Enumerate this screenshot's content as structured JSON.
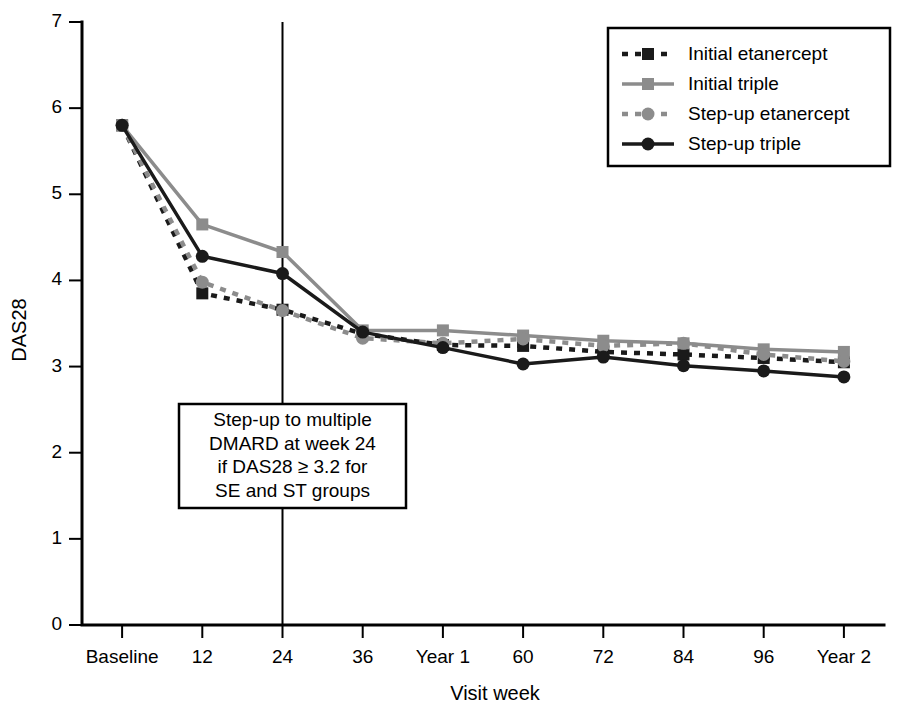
{
  "chart_data": {
    "type": "line",
    "title": "",
    "xlabel": "Visit week",
    "ylabel": "DAS28",
    "categories": [
      "Baseline",
      "12",
      "24",
      "36",
      "Year 1",
      "60",
      "72",
      "84",
      "96",
      "Year 2"
    ],
    "x": [
      0,
      1,
      2,
      3,
      4,
      5,
      6,
      7,
      8,
      9
    ],
    "ylim": [
      0,
      7
    ],
    "yticks": [
      "0",
      "1",
      "2",
      "3",
      "4",
      "5",
      "6",
      "7"
    ],
    "grid": false,
    "legend_position": "top-right",
    "series": [
      {
        "name": "Initial etanercept",
        "color": "#1a1a1a",
        "dash": "dashed",
        "marker": "square",
        "values": [
          5.8,
          3.85,
          3.66,
          3.38,
          3.25,
          3.24,
          3.17,
          3.14,
          3.1,
          3.05
        ]
      },
      {
        "name": "Initial triple",
        "color": "#8c8c8c",
        "dash": "solid",
        "marker": "square",
        "values": [
          5.8,
          4.65,
          4.33,
          3.42,
          3.42,
          3.36,
          3.3,
          3.27,
          3.2,
          3.17
        ]
      },
      {
        "name": "Step-up etanercept",
        "color": "#8c8c8c",
        "dash": "dashed",
        "marker": "circle",
        "values": [
          5.8,
          3.98,
          3.65,
          3.33,
          3.27,
          3.32,
          3.24,
          3.27,
          3.14,
          3.06
        ]
      },
      {
        "name": "Step-up triple",
        "color": "#1a1a1a",
        "dash": "solid",
        "marker": "circle",
        "values": [
          5.8,
          4.28,
          4.08,
          3.4,
          3.22,
          3.03,
          3.11,
          3.01,
          2.95,
          2.88
        ]
      }
    ],
    "annotations": [
      {
        "name": "step-up-note",
        "lines": [
          "Step-up to multiple",
          "DMARD at week 24",
          "if DAS28 ≥ 3.2 for",
          "SE and ST groups"
        ],
        "at_category": "24"
      }
    ],
    "reference_lines": [
      {
        "name": "week-24-vertical",
        "at_category": "24",
        "orientation": "vertical"
      }
    ]
  },
  "colors": {
    "black": "#1a1a1a",
    "gray": "#8c8c8c",
    "axis": "#000000",
    "background": "#ffffff"
  }
}
